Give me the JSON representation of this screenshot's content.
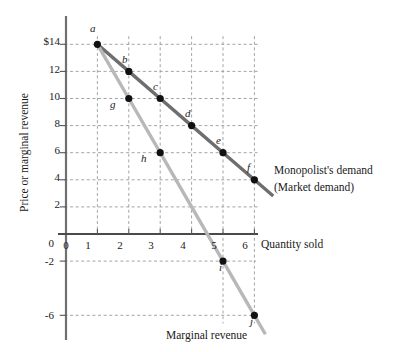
{
  "chart_data": {
    "type": "line",
    "title": "",
    "xlabel": "Quantity sold",
    "ylabel": "Price or marginal revenue",
    "xlim": [
      0,
      6.9
    ],
    "ylim": [
      -7.2,
      15.2
    ],
    "grid": true,
    "legend_position": "inline-right",
    "x_ticks": [
      "0",
      "1",
      "2",
      "3",
      "4",
      "5",
      "6"
    ],
    "x_tick_values": [
      0,
      1,
      2,
      3,
      4,
      5,
      6
    ],
    "y_ticks": [
      "$14",
      "12",
      "10",
      "8",
      "6",
      "4",
      "2",
      "0",
      "-2",
      "-6"
    ],
    "y_tick_values": [
      14,
      12,
      10,
      8,
      6,
      4,
      2,
      0,
      -2,
      -6
    ],
    "series": [
      {
        "name": "Monopolist's demand (Market demand)",
        "color": "#6e6e6e",
        "x": [
          1,
          2,
          3,
          4,
          5,
          6
        ],
        "values": [
          14,
          12,
          10,
          8,
          6,
          4
        ],
        "point_labels": [
          "a",
          "b",
          "c",
          "d",
          "e",
          "f"
        ],
        "extend_to": {
          "x": 6.6,
          "y": 2.8
        }
      },
      {
        "name": "Marginal revenue",
        "color": "#b8b8b8",
        "x": [
          1,
          2,
          3,
          5,
          6
        ],
        "values": [
          14,
          10,
          6,
          -2,
          -6
        ],
        "point_labels": [
          "a",
          "g",
          "h",
          "i",
          "j"
        ],
        "extend_to": {
          "x": 6.35,
          "y": -7.4
        }
      }
    ],
    "annotations": [
      {
        "name": "demand-label-line1",
        "text": "Monopolist's demand"
      },
      {
        "name": "demand-label-line2",
        "text": "(Market demand)"
      },
      {
        "name": "mr-label",
        "text": "Marginal revenue"
      }
    ]
  },
  "axis": {
    "x_title": "Quantity sold",
    "y_title": "Price or marginal revenue"
  },
  "point_labels": {
    "a": "a",
    "b": "b",
    "c": "c",
    "d": "d",
    "e": "e",
    "f": "f",
    "g": "g",
    "h": "h",
    "i": "i",
    "j": "j"
  },
  "ticks": {
    "y": {
      "t14": "$14",
      "t12": "12",
      "t10": "10",
      "t8": "8",
      "t6": "6",
      "t4": "4",
      "t2": "2",
      "t0": "0",
      "tm2": "-2",
      "tm6": "-6"
    },
    "x": {
      "x0": "0",
      "x1": "1",
      "x2": "2",
      "x3": "3",
      "x4": "4",
      "x5": "5",
      "x6": "6"
    }
  },
  "labels": {
    "demand_line1": "Monopolist's demand",
    "demand_line2": "(Market demand)",
    "marginal_revenue": "Marginal revenue"
  }
}
